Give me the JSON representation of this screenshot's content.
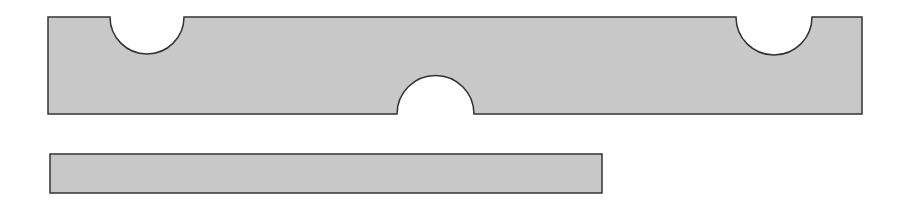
{
  "diagram": {
    "background": "#ffffff",
    "fill_color": "#c8c8c8",
    "stroke_color": "#333333",
    "shapes": [
      {
        "name": "notched-bar",
        "x": 48,
        "y": 17,
        "width": 814,
        "height": 97,
        "notches": [
          {
            "edge": "top",
            "x1": 110,
            "x2": 184
          },
          {
            "edge": "top",
            "x1": 736,
            "x2": 812
          },
          {
            "edge": "bottom",
            "x1": 397,
            "x2": 474
          }
        ]
      },
      {
        "name": "plain-bar",
        "x": 50,
        "y": 154,
        "width": 552,
        "height": 39
      }
    ]
  }
}
